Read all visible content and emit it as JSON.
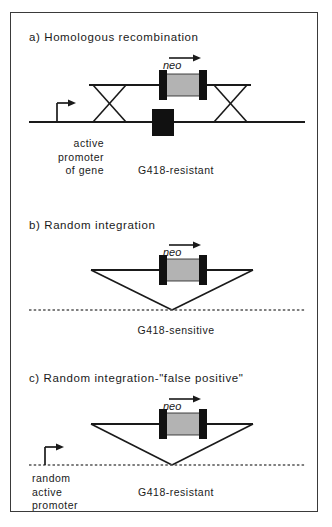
{
  "figure": {
    "panels": [
      {
        "id": "a",
        "title": "a)  Homologous recombination",
        "neo_label": "neo",
        "promoter_caption": "active\npromoter\nof gene",
        "outcome": "G418-resistant"
      },
      {
        "id": "b",
        "title": "b)  Random  integration",
        "neo_label": "neo",
        "promoter_caption": "",
        "outcome": "G418-sensitive"
      },
      {
        "id": "c",
        "title": "c)  Random  integration-\"false  positive\"",
        "neo_label": "neo",
        "promoter_caption": "random\nactive\npromoter",
        "outcome": "G418-resistant"
      }
    ],
    "colors": {
      "line": "#1a1a1a",
      "cassette_block": "#111111",
      "cassette_fill": "#b3b3b3",
      "exon_block": "#111111",
      "dashed_line": "#555555",
      "border": "#3a3a3a",
      "background": "#ffffff"
    }
  }
}
